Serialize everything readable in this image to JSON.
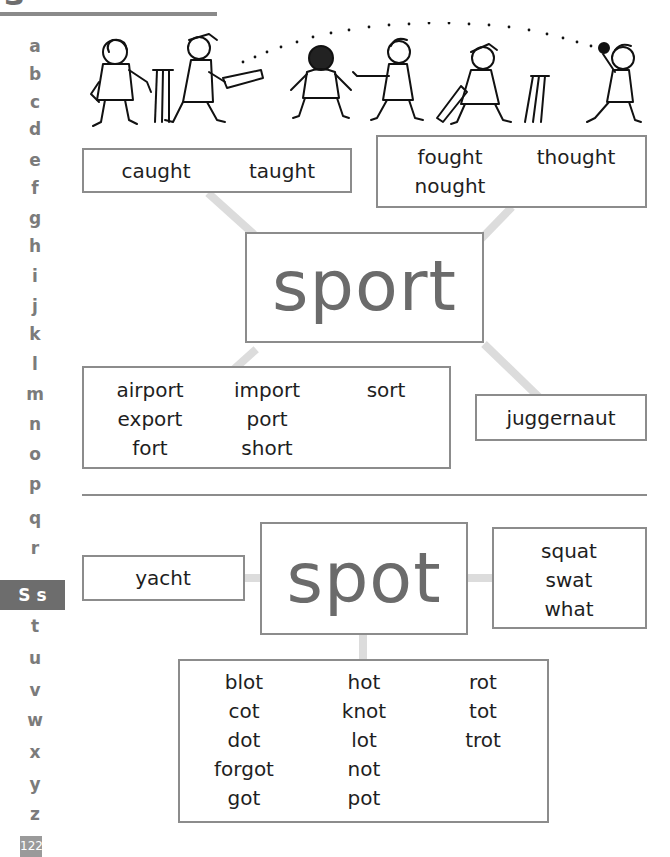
{
  "page": {
    "section_letter": "s",
    "page_number": "122",
    "active_letter_label": "S s"
  },
  "alphabet": [
    "a",
    "b",
    "c",
    "d",
    "e",
    "f",
    "g",
    "h",
    "i",
    "j",
    "k",
    "l",
    "m",
    "n",
    "o",
    "p",
    "q",
    "r",
    "S s",
    "t",
    "u",
    "v",
    "w",
    "x",
    "y",
    "z"
  ],
  "illustration": {
    "description": "cricket-scene-illustration"
  },
  "sport_group": {
    "headword": "sport",
    "caught_box": {
      "words": [
        "caught",
        "taught"
      ]
    },
    "fought_box": {
      "words": [
        "fought",
        "thought",
        "nought"
      ]
    },
    "ort_box": {
      "words": [
        "airport",
        "export",
        "fort",
        "import",
        "port",
        "short",
        "sort"
      ]
    },
    "juggernaut_box": {
      "words": [
        "juggernaut"
      ]
    }
  },
  "spot_group": {
    "headword": "spot",
    "yacht_box": {
      "words": [
        "yacht"
      ]
    },
    "squat_box": {
      "words": [
        "squat",
        "swat",
        "what"
      ]
    },
    "ot_box": {
      "words": [
        "blot",
        "cot",
        "dot",
        "forgot",
        "got",
        "hot",
        "knot",
        "lot",
        "not",
        "pot",
        "rot",
        "tot",
        "trot"
      ]
    }
  },
  "colors": {
    "box_border": "#8c8c8c",
    "connector": "#dcdcdc",
    "headword": "#6b6b6b",
    "sidebar_letter": "#7b7b7b",
    "active_tab_bg": "#6d6d6d"
  }
}
